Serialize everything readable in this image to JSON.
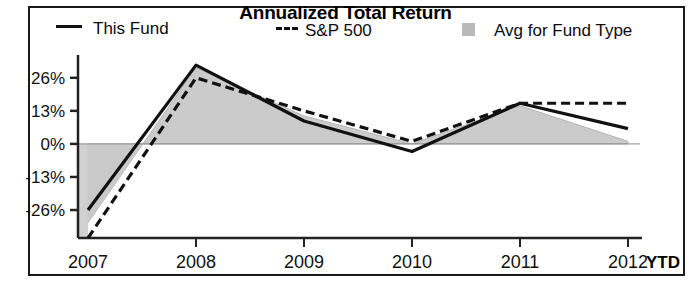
{
  "chart_data": {
    "type": "line",
    "title": "Annualized Total Return",
    "xlabel": "",
    "ylabel": "",
    "x": [
      "2007",
      "2008",
      "2009",
      "2010",
      "2011",
      "2012"
    ],
    "x_axis_suffix": "YTD",
    "ytick_labels": [
      "26%",
      "13%",
      "0%",
      "-13%",
      "-26%"
    ],
    "ytick_values": [
      26,
      13,
      0,
      -13,
      -26
    ],
    "ylim": [
      -37,
      33
    ],
    "grid": false,
    "legend_position": "top",
    "series": [
      {
        "name": "This Fund",
        "style": "solid",
        "color": "#111111",
        "values": [
          -26,
          31,
          9,
          -3,
          16,
          6
        ]
      },
      {
        "name": "S&P 500",
        "style": "dashed",
        "color": "#111111",
        "values": [
          -37,
          26,
          13,
          1,
          16,
          16
        ]
      },
      {
        "name": "Avg for Fund Type",
        "style": "area",
        "color": "#c9c9c9",
        "values": [
          -31,
          30,
          11,
          0,
          15,
          1
        ]
      }
    ]
  },
  "legend": {
    "fund_label": "This Fund",
    "sp_label": "S&P 500",
    "avg_label": "Avg for Fund Type"
  },
  "colors": {
    "line": "#111111",
    "area_fill": "#c9c9c9",
    "area_edge": "#b0b0b0",
    "axis": "#222222",
    "frame": "#1a1a1a",
    "text": "#0d0d0d"
  }
}
